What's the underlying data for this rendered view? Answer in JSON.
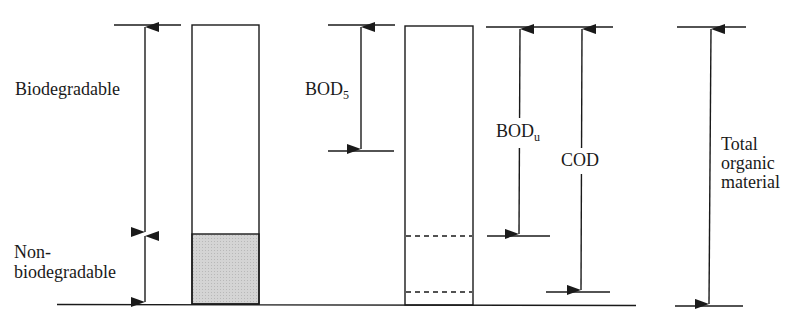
{
  "diagram": {
    "type": "stacked-bar-comparison",
    "colors": {
      "line": "#1a1a1a",
      "nonbiodegradable_fill": "#cfcfcf",
      "background": "#ffffff"
    },
    "left_bar": {
      "segments": [
        {
          "label": "Biodegradable",
          "shaded": false
        },
        {
          "label_line1": "Non-",
          "label_line2": "biodegradable",
          "shaded": true
        }
      ]
    },
    "right_bar": {
      "dashed_levels": [
        "BOD_u level",
        "COD level"
      ]
    },
    "labels": {
      "biodegradable": "Biodegradable",
      "nonbio_line1": "Non-",
      "nonbio_line2": "biodegradable",
      "bod5_main": "BOD",
      "bod5_sub": "5",
      "bodu_main": "BOD",
      "bodu_sub": "u",
      "cod": "COD",
      "total_line1": "Total",
      "total_line2": "organic",
      "total_line3": "material"
    }
  }
}
